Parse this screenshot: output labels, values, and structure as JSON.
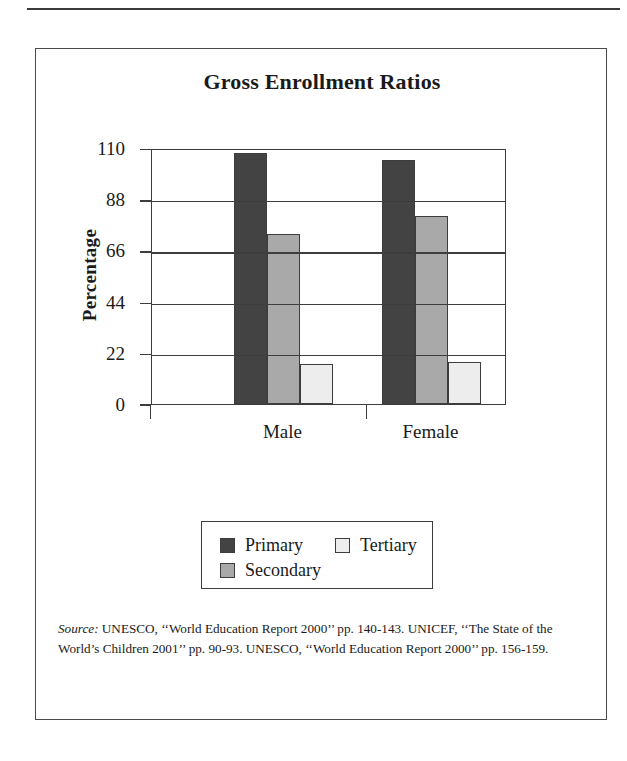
{
  "figure": {
    "title": "Gross Enrollment Ratios",
    "source_label": "Source:",
    "source_text": " UNESCO, ‘‘World Education Report 2000’’ pp. 140-143. UNICEF, ‘‘The State of the World’s Children 2001’’ pp. 90-93. UNESCO, ‘‘World Education Report 2000’’ pp. 156-159."
  },
  "chart_data": {
    "type": "bar",
    "title": "Gross Enrollment Ratios",
    "xlabel": "",
    "ylabel": "Percentage",
    "categories": [
      "Male",
      "Female"
    ],
    "series": [
      {
        "name": "Primary",
        "values": [
          108,
          105
        ],
        "color": "#434343"
      },
      {
        "name": "Secondary",
        "values": [
          73,
          81
        ],
        "color": "#a9a9a9"
      },
      {
        "name": "Tertiary",
        "values": [
          17,
          18
        ],
        "color": "#ededed"
      }
    ],
    "ylim": [
      0,
      110
    ],
    "yticks": [
      0,
      22,
      44,
      66,
      88,
      110
    ],
    "ytick_labels": [
      "0",
      "22",
      "44",
      "66",
      "88",
      "110"
    ],
    "grid": true,
    "grid_axis": "y",
    "legend_position": "below-plot",
    "legend_entries": [
      "Primary",
      "Secondary",
      "Tertiary"
    ]
  }
}
